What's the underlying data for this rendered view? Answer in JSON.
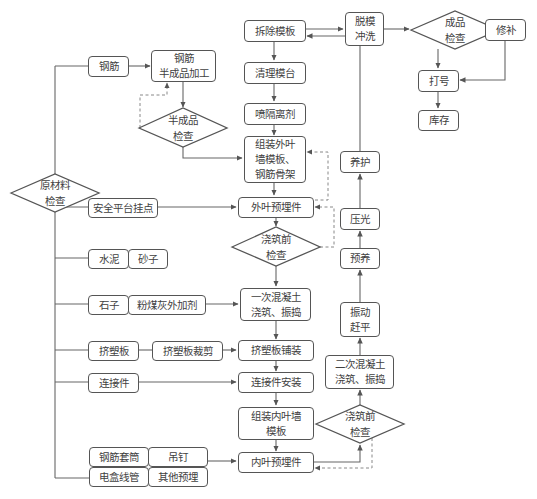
{
  "diagram": {
    "type": "flowchart",
    "colors": {
      "stroke": "#555555",
      "text": "#3f3f3f",
      "background": "#ffffff",
      "dashed": "#777777"
    },
    "nodes": {
      "raw_check": "原材料\n检查",
      "rebar": "钢筋",
      "rebar_semi": "钢筋\n半成品加工",
      "semi_check": "半成品\n检查",
      "remove_form": "拆除模板",
      "clean_table": "清理模台",
      "spray_agent": "喷隔离剂",
      "assemble_outer": "组装外叶\n墙模板、\n钢筋骨架",
      "outer_embed": "外叶预埋件",
      "pre_pour_check_1": "浇筑前\n检查",
      "first_pour": "一次混凝土\n浇筑、振捣",
      "xps_lay": "挤塑板铺装",
      "connector_install": "连接件安装",
      "assemble_inner": "组装内叶墙\n模板",
      "inner_embed": "内叶预埋件",
      "pre_pour_check_2": "浇筑前\n检查",
      "second_pour": "二次混凝土\n浇筑、振捣",
      "vibrate_level": "振动\n赶平",
      "pre_cure": "预养",
      "trowel": "压光",
      "cure": "养护",
      "demold_wash": "脱模\n冲洗",
      "product_check": "成品\n检查",
      "repair": "修补",
      "marking": "打号",
      "storage": "库存",
      "safety_anchor": "安全平台挂点",
      "cement": "水泥",
      "sand": "砂子",
      "gravel": "石子",
      "flyash": "粉煤灰外加剂",
      "xps": "挤塑板",
      "xps_cut": "挤塑板裁剪",
      "connector": "连接件",
      "rebar_sleeve": "钢筋套筒",
      "lifting_nail": "吊钉",
      "electrical_conduit": "电盒线管",
      "other_embed": "其他预埋"
    },
    "edges": [
      [
        "raw_check",
        "rebar"
      ],
      [
        "rebar",
        "rebar_semi"
      ],
      [
        "rebar_semi",
        "semi_check"
      ],
      [
        "semi_check",
        "rebar_semi",
        "dashed"
      ],
      [
        "semi_check",
        "assemble_outer"
      ],
      [
        "remove_form",
        "clean_table"
      ],
      [
        "clean_table",
        "spray_agent"
      ],
      [
        "spray_agent",
        "assemble_outer"
      ],
      [
        "assemble_outer",
        "outer_embed"
      ],
      [
        "outer_embed",
        "pre_pour_check_1"
      ],
      [
        "pre_pour_check_1",
        "first_pour"
      ],
      [
        "pre_pour_check_1",
        "outer_embed",
        "dashed"
      ],
      [
        "pre_pour_check_1",
        "assemble_outer",
        "dashed"
      ],
      [
        "first_pour",
        "xps_lay"
      ],
      [
        "xps_lay",
        "connector_install"
      ],
      [
        "connector_install",
        "assemble_inner"
      ],
      [
        "assemble_inner",
        "inner_embed"
      ],
      [
        "inner_embed",
        "pre_pour_check_2"
      ],
      [
        "pre_pour_check_2",
        "inner_embed",
        "dashed"
      ],
      [
        "pre_pour_check_2",
        "second_pour"
      ],
      [
        "second_pour",
        "vibrate_level"
      ],
      [
        "vibrate_level",
        "pre_cure"
      ],
      [
        "pre_cure",
        "trowel"
      ],
      [
        "trowel",
        "cure"
      ],
      [
        "cure",
        "remove_form"
      ],
      [
        "remove_form",
        "demold_wash"
      ],
      [
        "demold_wash",
        "product_check"
      ],
      [
        "product_check",
        "repair"
      ],
      [
        "product_check",
        "marking"
      ],
      [
        "repair",
        "marking"
      ],
      [
        "marking",
        "storage"
      ],
      [
        "raw_check",
        "safety_anchor"
      ],
      [
        "safety_anchor",
        "outer_embed"
      ],
      [
        "raw_check",
        "cement"
      ],
      [
        "raw_check",
        "gravel"
      ],
      [
        "flyash",
        "first_pour"
      ],
      [
        "raw_check",
        "xps"
      ],
      [
        "xps",
        "xps_cut"
      ],
      [
        "xps_cut",
        "xps_lay"
      ],
      [
        "raw_check",
        "connector"
      ],
      [
        "connector",
        "connector_install"
      ],
      [
        "raw_check",
        "rebar_sleeve"
      ],
      [
        "raw_check",
        "electrical_conduit"
      ],
      [
        "lifting_nail",
        "inner_embed"
      ]
    ]
  }
}
